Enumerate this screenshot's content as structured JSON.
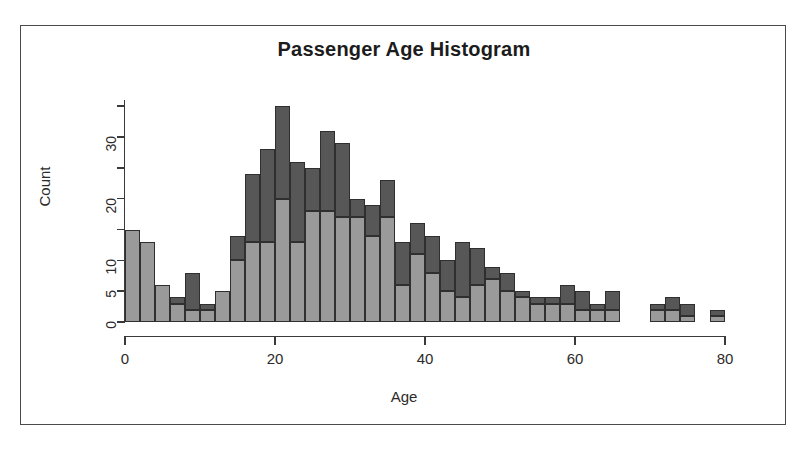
{
  "figure": {
    "title": "Passenger Age Histogram",
    "frame_color": "#4a4a4a",
    "background": "#ffffff"
  },
  "chart_data": {
    "type": "bar",
    "subtype": "stacked-histogram",
    "title": "Passenger Age Histogram",
    "xlabel": "Age",
    "ylabel": "Count",
    "xlim": [
      0,
      80
    ],
    "ylim": [
      0,
      36
    ],
    "bin_width": 2,
    "grid": false,
    "legend": null,
    "xticks": [
      0,
      20,
      40,
      60,
      80
    ],
    "xtick_labels": [
      "0",
      "20",
      "40",
      "60",
      "80"
    ],
    "yticks": [
      0,
      5,
      10,
      15,
      20,
      25,
      30,
      35
    ],
    "ytick_labels": [
      "0",
      "5",
      "10",
      "",
      "20",
      "",
      "30",
      ""
    ],
    "ytick_labeled": [
      0,
      5,
      10,
      20,
      30
    ],
    "colors": {
      "lower_series": "#9a9a9a",
      "upper_series": "#575757",
      "bar_outline": "#2f2f2f",
      "axis": "#3a3a3a"
    },
    "bin_starts": [
      0,
      2,
      4,
      6,
      8,
      10,
      12,
      14,
      16,
      18,
      20,
      22,
      24,
      26,
      28,
      30,
      32,
      34,
      36,
      38,
      40,
      42,
      44,
      46,
      48,
      50,
      52,
      54,
      56,
      58,
      60,
      62,
      64,
      66,
      68,
      70,
      72,
      74,
      76,
      78
    ],
    "series": [
      {
        "name": "lower",
        "values": [
          15,
          13,
          6,
          3,
          2,
          2,
          5,
          10,
          13,
          13,
          20,
          13,
          18,
          18,
          17,
          17,
          14,
          17,
          6,
          11,
          8,
          5,
          4,
          6,
          7,
          5,
          4,
          3,
          3,
          3,
          2,
          2,
          2,
          0,
          0,
          2,
          2,
          1,
          0,
          1
        ]
      },
      {
        "name": "upper",
        "values": [
          0,
          0,
          0,
          1,
          6,
          1,
          0,
          4,
          11,
          15,
          15,
          13,
          7,
          13,
          12,
          3,
          5,
          6,
          7,
          5,
          6,
          5,
          9,
          6,
          2,
          3,
          1,
          1,
          1,
          3,
          3,
          1,
          3,
          0,
          0,
          1,
          2,
          2,
          0,
          1
        ]
      }
    ],
    "totals": [
      15,
      13,
      6,
      4,
      8,
      3,
      5,
      14,
      24,
      28,
      35,
      26,
      25,
      31,
      29,
      20,
      19,
      23,
      13,
      16,
      14,
      10,
      13,
      12,
      9,
      8,
      5,
      4,
      4,
      6,
      5,
      3,
      5,
      0,
      0,
      3,
      4,
      3,
      0,
      2
    ]
  }
}
